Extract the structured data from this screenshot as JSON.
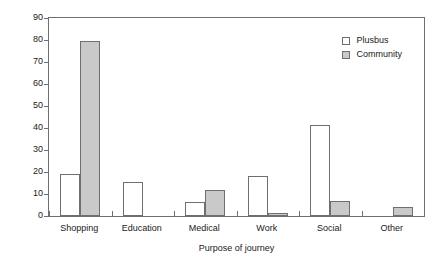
{
  "chart_data": {
    "type": "bar",
    "title": "",
    "xlabel": "Purpose of journey",
    "ylabel": "Percentage",
    "categories": [
      "Shopping",
      "Education",
      "Medical",
      "Work",
      "Social",
      "Other"
    ],
    "series": [
      {
        "name": "Plusbus",
        "color": "#ffffff",
        "values": [
          19,
          15.5,
          6.5,
          18,
          41.5,
          0
        ]
      },
      {
        "name": "Community",
        "color": "#c9c9c9",
        "values": [
          79.5,
          0,
          12,
          1.5,
          7,
          4
        ]
      }
    ],
    "ylim": [
      0,
      90
    ],
    "ytick_values": [
      0,
      10,
      20,
      30,
      40,
      50,
      60,
      70,
      80,
      90
    ],
    "ytick_labels": [
      "0",
      "10",
      "20",
      "30",
      "40",
      "50",
      "60",
      "70",
      "80",
      "90"
    ],
    "grid": false,
    "legend_position": "upper right",
    "bar_edge_color": "#6f6f6f",
    "axis_color": "#6f6f6f"
  },
  "legend": {
    "entries": [
      {
        "label": "Plusbus"
      },
      {
        "label": "Community"
      }
    ]
  }
}
